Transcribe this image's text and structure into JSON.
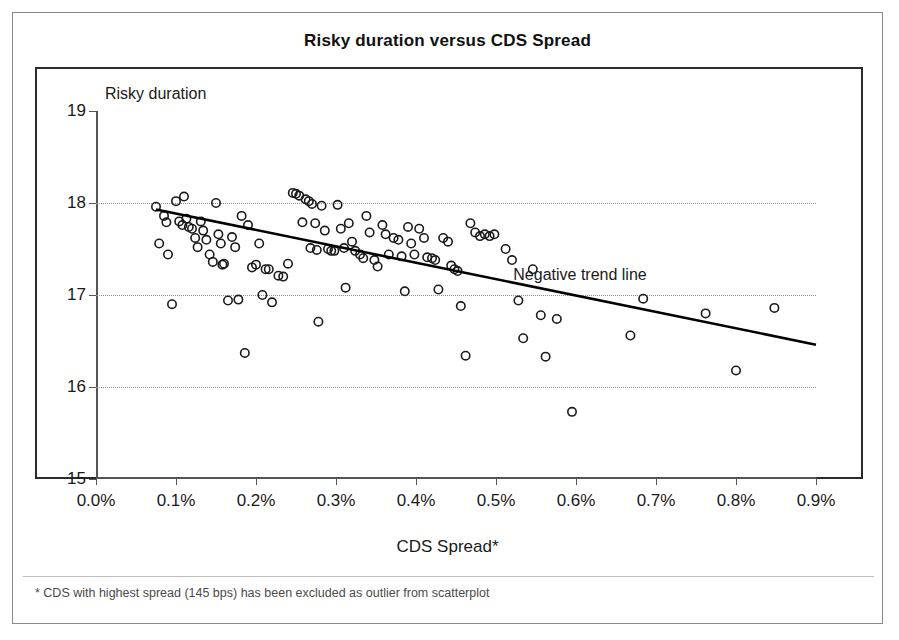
{
  "chart_data": {
    "type": "scatter",
    "title": "Risky duration versus CDS Spread",
    "xlabel": "CDS Spread*",
    "ylabel": "Risky duration",
    "xlim": [
      0.0,
      0.9
    ],
    "ylim": [
      15,
      19
    ],
    "x_ticks": [
      "0.0%",
      "0.1%",
      "0.2%",
      "0.3%",
      "0.4%",
      "0.5%",
      "0.6%",
      "0.7%",
      "0.8%",
      "0.9%"
    ],
    "x_tick_values": [
      0.0,
      0.1,
      0.2,
      0.3,
      0.4,
      0.5,
      0.6,
      0.7,
      0.8,
      0.9
    ],
    "y_ticks": [
      "15",
      "16",
      "17",
      "18",
      "19"
    ],
    "y_tick_values": [
      15,
      16,
      17,
      18,
      19
    ],
    "gridlines": [
      16,
      17,
      18
    ],
    "grid": true,
    "legend": "none",
    "footnote": "* CDS with highest spread (145 bps) has been excluded as outlier from scatterplot",
    "annotations": [
      {
        "text": "Negative trend line",
        "x": 0.605,
        "y": 17.22
      }
    ],
    "trendline": {
      "label": "Negative trend line",
      "x_start": 0.075,
      "y_start": 17.93,
      "x_end": 0.9,
      "y_end": 16.46,
      "color": "#000000"
    },
    "marker": {
      "shape": "circle-open",
      "color": "#1b1b1b",
      "radius": 4.2
    },
    "points": [
      [
        0.075,
        17.96
      ],
      [
        0.079,
        17.56
      ],
      [
        0.085,
        17.86
      ],
      [
        0.088,
        17.79
      ],
      [
        0.09,
        17.44
      ],
      [
        0.095,
        16.9
      ],
      [
        0.1,
        18.02
      ],
      [
        0.104,
        17.8
      ],
      [
        0.108,
        17.76
      ],
      [
        0.11,
        18.07
      ],
      [
        0.113,
        17.83
      ],
      [
        0.116,
        17.74
      ],
      [
        0.12,
        17.72
      ],
      [
        0.124,
        17.62
      ],
      [
        0.127,
        17.52
      ],
      [
        0.131,
        17.8
      ],
      [
        0.134,
        17.7
      ],
      [
        0.138,
        17.6
      ],
      [
        0.142,
        17.44
      ],
      [
        0.146,
        17.36
      ],
      [
        0.15,
        18.0
      ],
      [
        0.153,
        17.66
      ],
      [
        0.156,
        17.56
      ],
      [
        0.158,
        17.33
      ],
      [
        0.16,
        17.34
      ],
      [
        0.165,
        16.94
      ],
      [
        0.17,
        17.63
      ],
      [
        0.174,
        17.52
      ],
      [
        0.178,
        16.95
      ],
      [
        0.182,
        17.86
      ],
      [
        0.186,
        16.37
      ],
      [
        0.19,
        17.76
      ],
      [
        0.195,
        17.3
      ],
      [
        0.2,
        17.33
      ],
      [
        0.204,
        17.56
      ],
      [
        0.208,
        17.0
      ],
      [
        0.212,
        17.28
      ],
      [
        0.216,
        17.28
      ],
      [
        0.22,
        16.92
      ],
      [
        0.228,
        17.21
      ],
      [
        0.234,
        17.2
      ],
      [
        0.24,
        17.34
      ],
      [
        0.246,
        18.11
      ],
      [
        0.25,
        18.1
      ],
      [
        0.254,
        18.08
      ],
      [
        0.258,
        17.79
      ],
      [
        0.262,
        18.04
      ],
      [
        0.266,
        18.02
      ],
      [
        0.268,
        17.51
      ],
      [
        0.27,
        17.99
      ],
      [
        0.274,
        17.78
      ],
      [
        0.276,
        17.49
      ],
      [
        0.278,
        16.71
      ],
      [
        0.282,
        17.97
      ],
      [
        0.286,
        17.7
      ],
      [
        0.29,
        17.5
      ],
      [
        0.294,
        17.48
      ],
      [
        0.298,
        17.48
      ],
      [
        0.302,
        17.98
      ],
      [
        0.306,
        17.72
      ],
      [
        0.31,
        17.51
      ],
      [
        0.312,
        17.08
      ],
      [
        0.316,
        17.78
      ],
      [
        0.32,
        17.58
      ],
      [
        0.324,
        17.48
      ],
      [
        0.33,
        17.44
      ],
      [
        0.334,
        17.4
      ],
      [
        0.338,
        17.86
      ],
      [
        0.342,
        17.68
      ],
      [
        0.348,
        17.38
      ],
      [
        0.352,
        17.31
      ],
      [
        0.358,
        17.76
      ],
      [
        0.362,
        17.66
      ],
      [
        0.366,
        17.44
      ],
      [
        0.372,
        17.62
      ],
      [
        0.378,
        17.6
      ],
      [
        0.382,
        17.42
      ],
      [
        0.386,
        17.04
      ],
      [
        0.39,
        17.74
      ],
      [
        0.394,
        17.56
      ],
      [
        0.398,
        17.44
      ],
      [
        0.404,
        17.72
      ],
      [
        0.41,
        17.62
      ],
      [
        0.414,
        17.41
      ],
      [
        0.42,
        17.4
      ],
      [
        0.424,
        17.38
      ],
      [
        0.428,
        17.06
      ],
      [
        0.434,
        17.62
      ],
      [
        0.44,
        17.58
      ],
      [
        0.444,
        17.32
      ],
      [
        0.448,
        17.28
      ],
      [
        0.452,
        17.26
      ],
      [
        0.456,
        16.88
      ],
      [
        0.462,
        16.34
      ],
      [
        0.468,
        17.78
      ],
      [
        0.474,
        17.68
      ],
      [
        0.48,
        17.64
      ],
      [
        0.486,
        17.66
      ],
      [
        0.492,
        17.64
      ],
      [
        0.498,
        17.66
      ],
      [
        0.512,
        17.5
      ],
      [
        0.52,
        17.38
      ],
      [
        0.528,
        16.94
      ],
      [
        0.534,
        16.53
      ],
      [
        0.546,
        17.28
      ],
      [
        0.556,
        16.78
      ],
      [
        0.562,
        16.33
      ],
      [
        0.576,
        16.74
      ],
      [
        0.595,
        15.73
      ],
      [
        0.668,
        16.56
      ],
      [
        0.684,
        16.96
      ],
      [
        0.762,
        16.8
      ],
      [
        0.8,
        16.18
      ],
      [
        0.848,
        16.86
      ]
    ]
  }
}
